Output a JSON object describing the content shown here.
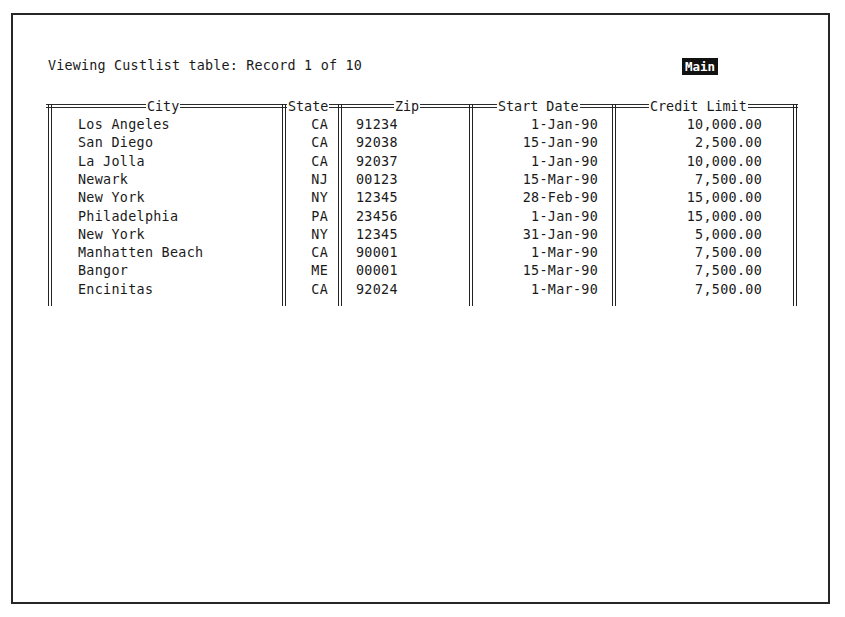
{
  "status": {
    "text": "Viewing Custlist table: Record 1 of 10",
    "mode": "Main"
  },
  "table": {
    "name": "Custlist",
    "current_record": 1,
    "total_records": 10,
    "columns": [
      "City",
      "State",
      "Zip",
      "Start Date",
      "Credit Limit"
    ],
    "rows": [
      {
        "city": "Los Angeles",
        "state": "CA",
        "zip": "91234",
        "start_date": "1-Jan-90",
        "credit_limit": "10,000.00"
      },
      {
        "city": "San Diego",
        "state": "CA",
        "zip": "92038",
        "start_date": "15-Jan-90",
        "credit_limit": "2,500.00"
      },
      {
        "city": "La Jolla",
        "state": "CA",
        "zip": "92037",
        "start_date": "1-Jan-90",
        "credit_limit": "10,000.00"
      },
      {
        "city": "Newark",
        "state": "NJ",
        "zip": "00123",
        "start_date": "15-Mar-90",
        "credit_limit": "7,500.00"
      },
      {
        "city": "New York",
        "state": "NY",
        "zip": "12345",
        "start_date": "28-Feb-90",
        "credit_limit": "15,000.00"
      },
      {
        "city": "Philadelphia",
        "state": "PA",
        "zip": "23456",
        "start_date": "1-Jan-90",
        "credit_limit": "15,000.00"
      },
      {
        "city": "New York",
        "state": "NY",
        "zip": "12345",
        "start_date": "31-Jan-90",
        "credit_limit": "5,000.00"
      },
      {
        "city": "Manhatten Beach",
        "state": "CA",
        "zip": "90001",
        "start_date": "1-Mar-90",
        "credit_limit": "7,500.00"
      },
      {
        "city": "Bangor",
        "state": "ME",
        "zip": "00001",
        "start_date": "15-Mar-90",
        "credit_limit": "7,500.00"
      },
      {
        "city": "Encinitas",
        "state": "CA",
        "zip": "92024",
        "start_date": "1-Mar-90",
        "credit_limit": "7,500.00"
      }
    ]
  },
  "colors": {
    "background": "#ffffff",
    "text": "#1a1a1a",
    "badge_bg": "#111111",
    "badge_text": "#ffffff"
  }
}
